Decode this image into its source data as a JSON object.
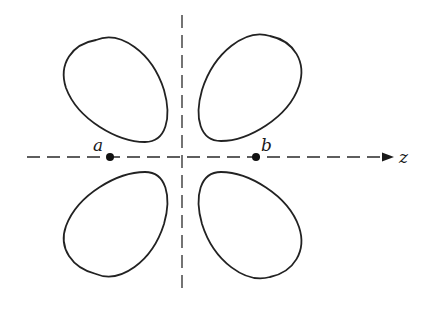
{
  "diagram": {
    "type": "d-orbital lobe cross-section",
    "axes": {
      "horizontal": {
        "label": "z",
        "dashed": true,
        "arrow": true
      },
      "vertical": {
        "label": "",
        "dashed": true,
        "arrow": false
      }
    },
    "points": [
      {
        "id": "a",
        "label": "a",
        "position": "left of origin on z-axis"
      },
      {
        "id": "b",
        "label": "b",
        "position": "right of origin on z-axis"
      }
    ],
    "lobes": [
      {
        "id": "top-left",
        "quadrant": "upper-left"
      },
      {
        "id": "top-right",
        "quadrant": "upper-right"
      },
      {
        "id": "bottom-left",
        "quadrant": "lower-left"
      },
      {
        "id": "bottom-right",
        "quadrant": "lower-right"
      }
    ],
    "colors": {
      "ink": "#222222",
      "background": "#ffffff"
    }
  }
}
